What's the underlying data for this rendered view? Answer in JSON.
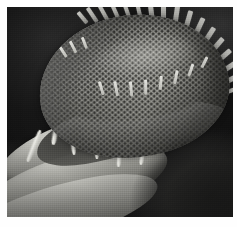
{
  "figure": {
    "kind": "sem-micrograph",
    "subject_detail": "centric diatom valve with areolae and marginal spines",
    "modality": "scanning electron microscopy",
    "color_mode": "grayscale",
    "width_px": 237,
    "height_px": 227,
    "alt_text": "Grayscale scanning electron micrograph of a dome-shaped diatom valve covered in a honeycomb pattern of pores, with spines radiating from its upper rim and bright banded girdle structures below, on a dark background."
  },
  "plate": {
    "border_color": "#ffffff",
    "border_top_px": 7,
    "border_left_px": 8,
    "border_right_px": 4,
    "border_bottom_px": 10,
    "inner_width_px": 226,
    "inner_height_px": 210
  },
  "palette": {
    "background_dark": "#171717",
    "background_darkest": "#121212",
    "background_upper_right": "#3b3b3b",
    "specimen_highlight": "#d9d9d4",
    "specimen_midtone": "#9b9b95",
    "specimen_shadow": "#565651",
    "pore_shadow": "#1e1e1c",
    "page_white": "#ffffff"
  },
  "structures": {
    "valve": {
      "label": "valve face",
      "shape": "dome",
      "surface": "hexagonally packed areolae (pores)",
      "tilt_deg": -7
    },
    "spines": {
      "label": "marginal spines",
      "count": 17,
      "location": "upper and right rim of valve"
    },
    "face_ridges": {
      "label": "hyaline ridge marks",
      "count": 11
    },
    "girdle": {
      "label": "girdle bands (cingulum)",
      "band_count": 3
    },
    "strands": {
      "label": "mucilage strands",
      "count": 7
    }
  }
}
